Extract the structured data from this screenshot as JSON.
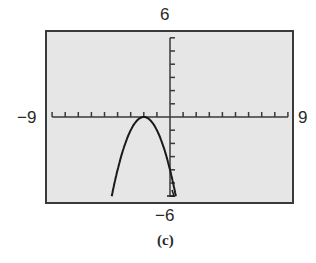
{
  "chart_data": {
    "type": "line",
    "title": "",
    "caption": "(c)",
    "xlabel": "",
    "ylabel": "",
    "xlim": [
      -9,
      9
    ],
    "ylim": [
      -6,
      6
    ],
    "xscale_ticks": 1,
    "yscale_ticks": 1,
    "grid": false,
    "window_labels": {
      "xmin": "−9",
      "xmax": "9",
      "ymin": "−6",
      "ymax": "6"
    },
    "series": [
      {
        "name": "y = -(x + 2)^2",
        "vertex": [
          -2,
          0
        ],
        "x": [
          -4.45,
          -4,
          -3.5,
          -3,
          -2.5,
          -2,
          -1.5,
          -1,
          -0.5,
          0,
          0.45
        ],
        "y": [
          -6,
          -4,
          -2.25,
          -1,
          -0.25,
          0,
          -0.25,
          -1,
          -2.25,
          -4,
          -6
        ]
      }
    ],
    "colors": {
      "screen_background": "#e6e6e6",
      "frame": "#3a3a3a",
      "curve": "#1a1a1a",
      "axes": "#3a3a3a"
    }
  }
}
